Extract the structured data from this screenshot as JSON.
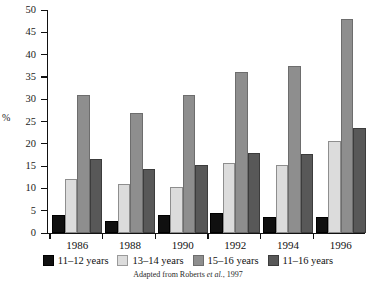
{
  "chart_data": {
    "type": "bar",
    "title": "",
    "subtitle": "",
    "xlabel": "",
    "ylabel": "%",
    "categories": [
      "1986",
      "1988",
      "1990",
      "1992",
      "1994",
      "1996"
    ],
    "ylim": [
      0,
      50
    ],
    "ytick_step": 5,
    "yticks": [
      0,
      5,
      10,
      15,
      20,
      25,
      30,
      35,
      40,
      45,
      50
    ],
    "ytick_labels": [
      "0",
      "5",
      "10",
      "15",
      "20",
      "25",
      "30",
      "35",
      "40",
      "45",
      "50"
    ],
    "grid": false,
    "legend_position": "bottom",
    "series": [
      {
        "name": "11–12 years",
        "color": "#101010",
        "values": [
          4.0,
          2.8,
          4.0,
          4.4,
          3.6,
          3.5
        ]
      },
      {
        "name": "13–14 years",
        "color": "#dcdcdc",
        "values": [
          12.0,
          11.0,
          10.3,
          15.7,
          15.3,
          20.7
        ]
      },
      {
        "name": "15–16 years",
        "color": "#8e8e8e",
        "values": [
          31.0,
          26.8,
          31.0,
          36.0,
          37.5,
          48.0
        ]
      },
      {
        "name": "11–16 years",
        "color": "#585858",
        "values": [
          16.5,
          14.3,
          15.3,
          18.0,
          17.7,
          23.5
        ]
      }
    ],
    "annotations": {
      "caption_prefix": "Adapted from Roberts ",
      "caption_italic": "et al.",
      "caption_suffix": ", 1997"
    }
  },
  "legend": {
    "items": [
      {
        "label": "11–12 years",
        "swatch": "legend-swatch-11-12"
      },
      {
        "label": "13–14 years",
        "swatch": "legend-swatch-13-14"
      },
      {
        "label": "15–16 years",
        "swatch": "legend-swatch-15-16"
      },
      {
        "label": "11–16 years",
        "swatch": "legend-swatch-11-16"
      }
    ]
  }
}
